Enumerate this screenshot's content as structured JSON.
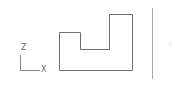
{
  "view": {
    "type": "orthographic-2d",
    "plane": "XZ"
  },
  "axis_indicator": {
    "vertical_label": "Z",
    "horizontal_label": "X"
  },
  "profile": {
    "stroke_color": "#6e6e6e",
    "points": [
      [
        59,
        70
      ],
      [
        59,
        32
      ],
      [
        80,
        32
      ],
      [
        80,
        49
      ],
      [
        109,
        49
      ],
      [
        109,
        14
      ],
      [
        132,
        14
      ],
      [
        132,
        70
      ]
    ]
  },
  "divider": {
    "color": "#a8a8a8"
  }
}
